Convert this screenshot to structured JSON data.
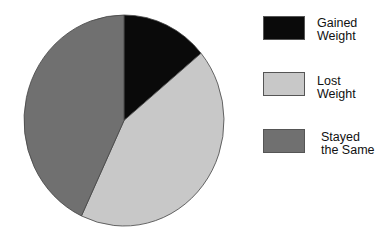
{
  "chart_data": {
    "type": "pie",
    "title": "",
    "categories": [
      "Gained Weight",
      "Lost Weight",
      "Stayed the Same"
    ],
    "values": [
      14,
      43,
      43
    ],
    "colors": [
      "#0a0a0a",
      "#c8c8c8",
      "#707070"
    ],
    "start_angle_deg": 0,
    "direction": "clockwise",
    "legend_position": "right"
  },
  "legend": [
    {
      "line1": "Gained",
      "line2": "Weight",
      "color": "#0a0a0a"
    },
    {
      "line1": "Lost",
      "line2": "Weight",
      "color": "#c8c8c8"
    },
    {
      "line1": "Stayed",
      "line2": "the Same",
      "color": "#707070"
    }
  ]
}
